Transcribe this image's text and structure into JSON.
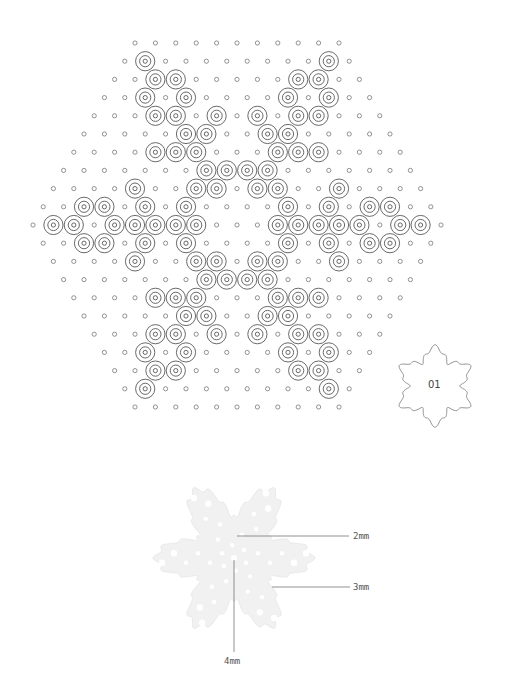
{
  "pattern": {
    "grid": {
      "row_spacing": 18.2,
      "col_spacing": 20.4,
      "first_row_y": 43,
      "first_row_x": 135,
      "small_radius": 2.1,
      "bead_outer_radius": 9.6,
      "bead_mid_radius": 5.6,
      "bead_inner_radius": 2.1,
      "stroke_color": "#444444",
      "legend": {
        "o": "empty-peg",
        "X": "bead"
      },
      "rows": [
        "ooooooooooo",
        "oXooooooooXo",
        "ooXXoooooXXoo",
        "ooXoXooooXoXoo",
        "oooXXoXoXoXXooo",
        "oooooXXooXXooooo",
        "ooooXXXoooXXXoooo",
        "oooooooXXXXooooooo",
        "ooooXooXXoXXooXoooo",
        "ooXXoXoXooooXoXoXXoo",
        "oXXoXXXXXoooXXXXXoXXo",
        "ooXXoXoXooooXoXoXXoo",
        "ooooXooXXoXXooXoooo",
        "oooooooXXXXooooooo",
        "ooooXXXoooXXXoooo",
        "oooooXXooXXooooo",
        "oooXXoXoXoXXooo",
        "ooXoXooooXoXoo",
        "ooXXoooooXXoo",
        "oXooooooooXo",
        "ooooooooooo"
      ]
    },
    "badge": {
      "label": "01",
      "cx": 435,
      "cy": 386,
      "outline_color": "#777777"
    }
  },
  "preview": {
    "center": [
      234,
      558
    ],
    "fill_color": "#f1f1f1",
    "hole_color": "#ffffff",
    "leader_color": "#777777",
    "callouts": [
      {
        "label": "2mm",
        "line": [
          237,
          536,
          349,
          536
        ],
        "text_pos": [
          353,
          540
        ]
      },
      {
        "label": "3mm",
        "line": [
          272,
          587,
          350,
          587
        ],
        "text_pos": [
          353,
          591
        ]
      },
      {
        "label": "4mm",
        "line": [
          234,
          560,
          234,
          652
        ],
        "text_pos": [
          224,
          665
        ]
      }
    ]
  }
}
